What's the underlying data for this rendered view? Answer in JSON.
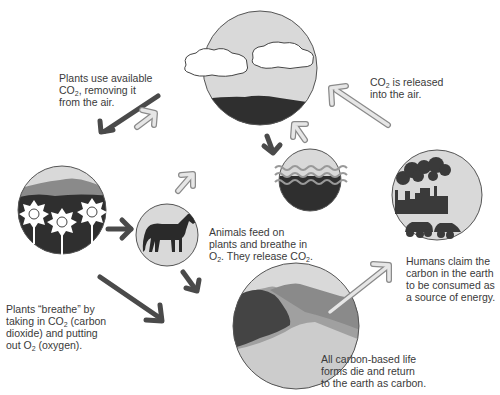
{
  "diagram": {
    "title_visible": false,
    "colors": {
      "sky": "#d9d9d9",
      "outline": "#555555",
      "dark": "#2f2f2f",
      "mid": "#7a7a7a",
      "light": "#bdbdbd",
      "arrow_dark": "#4a4a4a",
      "arrow_light": "#e6e6e6",
      "arrow_light_stroke": "#8a8a8a"
    },
    "nodes": [
      {
        "id": "atmosphere",
        "description": "sky with two clouds over dark land"
      },
      {
        "id": "plants",
        "description": "hills with three white flowers"
      },
      {
        "id": "animals",
        "description": "horse silhouette"
      },
      {
        "id": "ocean",
        "description": "water waves"
      },
      {
        "id": "earth",
        "description": "layered earth / mountains"
      },
      {
        "id": "humans",
        "description": "factory with smoke and cars"
      }
    ],
    "labels": {
      "plants_use": {
        "line1": "Plants use available",
        "line2_pre": "CO",
        "line2_sub": "2",
        "line2_post": ", removing it",
        "line3": "from the air."
      },
      "co2_released": {
        "line1_pre": "CO",
        "line1_sub": "2",
        "line1_post": " is released",
        "line2": "into the air."
      },
      "animals_feed": {
        "line1": "Animals feed on",
        "line2": "plants and breathe in",
        "line3_pre": "O",
        "line3_sub": "2",
        "line3_mid": ". They release CO",
        "line3_sub2": "2",
        "line3_post": "."
      },
      "humans_claim": {
        "line1": "Humans claim the",
        "line2": "carbon in the earth",
        "line3": "to be consumed as",
        "line4": "a source of energy."
      },
      "plants_breathe": {
        "line1": "Plants “breathe” by",
        "line2_pre": "taking in CO",
        "line2_sub": "2",
        "line2_post": " (carbon",
        "line3": "dioxide) and putting",
        "line4_pre": "out O",
        "line4_sub": "2",
        "line4_post": " (oxygen)."
      },
      "carbon_life": {
        "line1": "All carbon-based life",
        "line2": "forms die and return",
        "line3": "to the earth as carbon."
      }
    }
  }
}
